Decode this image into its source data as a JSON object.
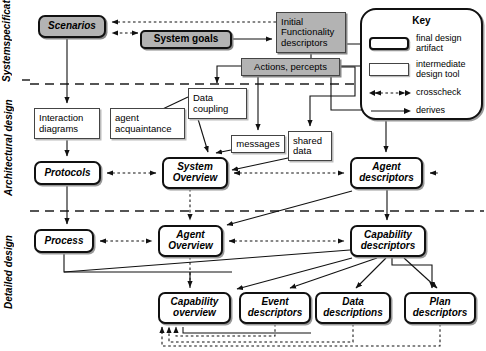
{
  "diagram": {
    "phases": [
      {
        "id": "system-specification",
        "label": "System\nspecification"
      },
      {
        "id": "architectural-design",
        "label": "Architectural design"
      },
      {
        "id": "detailed-design",
        "label": "Detailed design"
      }
    ],
    "nodes": [
      {
        "id": "scenarios",
        "label": "Scenarios",
        "kind": "shaded-final",
        "x": 38,
        "y": 15,
        "w": 68,
        "h": 23,
        "font": 10
      },
      {
        "id": "system-goals",
        "label": "System goals",
        "kind": "shaded-inter-bold",
        "x": 140,
        "y": 30,
        "w": 92,
        "h": 19,
        "font": 10
      },
      {
        "id": "initial-functionality-descriptors",
        "label": "Initial\nFunctionality\ndescriptors",
        "kind": "shaded-inter",
        "x": 276,
        "y": 12,
        "w": 70,
        "h": 41,
        "font": 9.5
      },
      {
        "id": "actions-percepts",
        "label": "Actions, percepts",
        "kind": "shaded-inter",
        "x": 241,
        "y": 58,
        "w": 99,
        "h": 18,
        "font": 9.5
      },
      {
        "id": "interaction-diagrams",
        "label": "Interaction\ndiagrams",
        "kind": "inter",
        "x": 34,
        "y": 108,
        "w": 66,
        "h": 31,
        "font": 9.5
      },
      {
        "id": "agent-acquaintance",
        "label": "agent\nacquaintance",
        "kind": "inter",
        "x": 110,
        "y": 108,
        "w": 75,
        "h": 31,
        "font": 9.5
      },
      {
        "id": "data-coupling",
        "label": "Data\ncoupling",
        "kind": "inter",
        "x": 188,
        "y": 88,
        "w": 59,
        "h": 31,
        "font": 9.5
      },
      {
        "id": "messages",
        "label": "messages",
        "kind": "inter",
        "x": 231,
        "y": 135,
        "w": 54,
        "h": 18,
        "font": 9.5
      },
      {
        "id": "shared-data",
        "label": "shared\ndata",
        "kind": "inter",
        "x": 288,
        "y": 131,
        "w": 44,
        "h": 30,
        "font": 9.5
      },
      {
        "id": "protocols",
        "label": "Protocols",
        "kind": "final",
        "x": 34,
        "y": 161,
        "w": 67,
        "h": 24,
        "font": 10
      },
      {
        "id": "system-overview",
        "label": "System\nOverview",
        "kind": "final",
        "x": 162,
        "y": 157,
        "w": 66,
        "h": 32,
        "font": 10
      },
      {
        "id": "agent-descriptors",
        "label": "Agent\ndescriptors",
        "kind": "final",
        "x": 350,
        "y": 157,
        "w": 73,
        "h": 32,
        "font": 10
      },
      {
        "id": "process",
        "label": "Process",
        "kind": "final",
        "x": 34,
        "y": 229,
        "w": 60,
        "h": 24,
        "font": 10
      },
      {
        "id": "agent-overview",
        "label": "Agent\nOverview",
        "kind": "final",
        "x": 158,
        "y": 225,
        "w": 65,
        "h": 32,
        "font": 10
      },
      {
        "id": "capability-descriptors",
        "label": "Capability\ndescriptors",
        "kind": "final",
        "x": 350,
        "y": 225,
        "w": 76,
        "h": 32,
        "font": 10
      },
      {
        "id": "capability-overview",
        "label": "Capability\noverview",
        "kind": "final",
        "x": 158,
        "y": 292,
        "w": 73,
        "h": 32,
        "font": 10
      },
      {
        "id": "event-descriptors",
        "label": "Event\ndescriptors",
        "kind": "final",
        "x": 239,
        "y": 292,
        "w": 72,
        "h": 32,
        "font": 10
      },
      {
        "id": "data-descriptions",
        "label": "Data\ndescriptions",
        "kind": "final",
        "x": 315,
        "y": 292,
        "w": 76,
        "h": 32,
        "font": 10
      },
      {
        "id": "plan-descriptors",
        "label": "Plan\ndescriptors",
        "kind": "final",
        "x": 404,
        "y": 292,
        "w": 72,
        "h": 32,
        "font": 10
      }
    ],
    "dividers": [
      {
        "id": "divider-spec-arch",
        "y": 84
      },
      {
        "id": "divider-arch-detail",
        "y": 211
      }
    ],
    "edges": [
      {
        "from": "system-goals",
        "to": "scenarios",
        "type": "crosscheck"
      },
      {
        "from": "initial-functionality-descriptors",
        "to": "scenarios",
        "type": "crosscheck"
      },
      {
        "from": "system-goals",
        "to": "initial-functionality-descriptors",
        "type": "derives"
      },
      {
        "from": "scenarios",
        "to": "interaction-diagrams",
        "type": "derives"
      },
      {
        "from": "initial-functionality-descriptors",
        "to": "data-coupling",
        "type": "derives"
      },
      {
        "from": "data-coupling",
        "to": "agent-acquaintance",
        "type": "derives"
      },
      {
        "from": "data-coupling",
        "to": "system-overview",
        "type": "derives"
      },
      {
        "from": "interaction-diagrams",
        "to": "protocols",
        "type": "derives"
      },
      {
        "from": "protocols",
        "to": "system-overview",
        "type": "crosscheck"
      },
      {
        "from": "messages",
        "to": "system-overview",
        "type": "derives"
      },
      {
        "from": "shared-data",
        "to": "system-overview",
        "type": "derives"
      },
      {
        "from": "system-overview",
        "to": "agent-descriptors",
        "type": "crosscheck"
      },
      {
        "from": "protocols",
        "to": "process",
        "type": "derives"
      },
      {
        "from": "process",
        "to": "agent-overview",
        "type": "crosscheck"
      },
      {
        "from": "agent-overview",
        "to": "capability-descriptors",
        "type": "crosscheck"
      },
      {
        "from": "system-overview",
        "to": "agent-overview",
        "type": "crosscheck"
      },
      {
        "from": "agent-descriptors",
        "to": "capability-descriptors",
        "type": "derives"
      },
      {
        "from": "agent-overview",
        "to": "capability-overview",
        "type": "crosscheck"
      },
      {
        "from": "capability-descriptors",
        "to": "event-descriptors",
        "type": "derives"
      },
      {
        "from": "capability-descriptors",
        "to": "data-descriptions",
        "type": "derives"
      },
      {
        "from": "capability-descriptors",
        "to": "plan-descriptors",
        "type": "derives"
      },
      {
        "from": "capability-descriptors",
        "to": "capability-overview",
        "type": "derives"
      },
      {
        "from": "event-descriptors",
        "to": "capability-overview",
        "type": "crosscheck"
      },
      {
        "from": "data-descriptions",
        "to": "capability-overview",
        "type": "crosscheck"
      },
      {
        "from": "plan-descriptors",
        "to": "capability-overview",
        "type": "crosscheck"
      }
    ]
  },
  "key": {
    "title": "Key",
    "items": [
      {
        "id": "final-design-artifact",
        "symbol": "rounded-thick-box",
        "label": "final design\nartifact"
      },
      {
        "id": "intermediate-design-tool",
        "symbol": "square-thin-box",
        "label": "intermediate\ndesign tool"
      },
      {
        "id": "crosscheck",
        "symbol": "dashed-double-arrow",
        "label": "crosscheck"
      },
      {
        "id": "derives",
        "symbol": "solid-arrow",
        "label": "derives"
      }
    ]
  },
  "colors": {
    "shaded_fill": "#b3b3b3",
    "plain_fill": "#ffffff",
    "stroke": "#111111",
    "divider": "#555555"
  }
}
